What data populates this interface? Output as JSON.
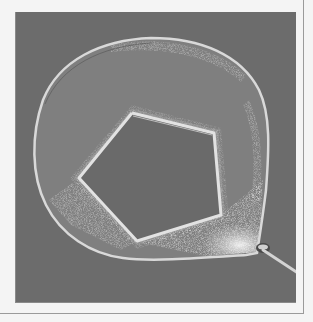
{
  "image": {
    "description": "Photograph of a soap film spanning a wire loop with a pentagon-shaped thread loop pulled taut in the middle, leaving a pentagonal hole in the film",
    "subject": "soap film on wire loop with thread pentagon",
    "colors": {
      "page_background": "#f4f4f4",
      "frame_line": "#9a9a9a",
      "photo_background": "#6c6c6c",
      "soap_film": "#7f7f7f",
      "pentagon_hole": "#6a6a6a",
      "wire": "#d8d8d8",
      "foam": "#e6e6e6"
    }
  }
}
